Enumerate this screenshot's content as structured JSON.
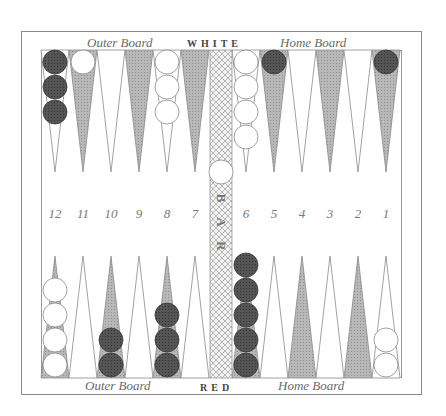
{
  "board": {
    "top_labels": {
      "outer": "Outer Board",
      "player": "WHITE",
      "home": "Home Board"
    },
    "bottom_labels": {
      "outer": "Outer Board",
      "player": "RED",
      "home": "Home Board"
    },
    "bar_label": "BAR",
    "point_numbers": [
      "12",
      "11",
      "10",
      "9",
      "8",
      "7",
      "6",
      "5",
      "4",
      "3",
      "2",
      "1"
    ],
    "colors": {
      "dark_point": "#a9a9a9",
      "light_point": "#ffffff",
      "red_checker": "#4a4a4a",
      "white_checker": "#ffffff",
      "bar": "#d4d4d4",
      "border": "#8a8a8a"
    },
    "top_row": [
      {
        "column": "12",
        "color": "red",
        "count": 3
      },
      {
        "column": "11",
        "color": "white",
        "count": 1
      },
      {
        "column": "10",
        "color": null,
        "count": 0
      },
      {
        "column": "9",
        "color": null,
        "count": 0
      },
      {
        "column": "8",
        "color": "white",
        "count": 3
      },
      {
        "column": "7",
        "color": null,
        "count": 0
      },
      {
        "column": "6",
        "color": "white",
        "count": 4
      },
      {
        "column": "5",
        "color": "red",
        "count": 1
      },
      {
        "column": "4",
        "color": null,
        "count": 0
      },
      {
        "column": "3",
        "color": null,
        "count": 0
      },
      {
        "column": "2",
        "color": null,
        "count": 0
      },
      {
        "column": "1",
        "color": "red",
        "count": 1
      }
    ],
    "bottom_row": [
      {
        "column": "12",
        "color": "white",
        "count": 4
      },
      {
        "column": "11",
        "color": null,
        "count": 0
      },
      {
        "column": "10",
        "color": "red",
        "count": 2
      },
      {
        "column": "9",
        "color": null,
        "count": 0
      },
      {
        "column": "8",
        "color": "red",
        "count": 3
      },
      {
        "column": "7",
        "color": null,
        "count": 0
      },
      {
        "column": "6",
        "color": "red",
        "count": 5
      },
      {
        "column": "5",
        "color": null,
        "count": 0
      },
      {
        "column": "4",
        "color": null,
        "count": 0
      },
      {
        "column": "3",
        "color": null,
        "count": 0
      },
      {
        "column": "2",
        "color": null,
        "count": 0
      },
      {
        "column": "1",
        "color": "white",
        "count": 2
      }
    ],
    "bar_checkers": [
      {
        "color": "white",
        "count": 1
      }
    ]
  }
}
